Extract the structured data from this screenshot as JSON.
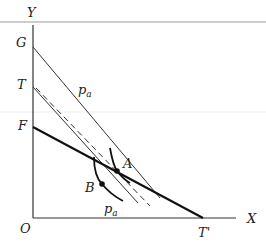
{
  "diagram": {
    "axes": {
      "y_label": "Y",
      "x_label": "X",
      "origin_label": "O"
    },
    "intercept_labels": {
      "G": "G",
      "T": "T",
      "F": "F",
      "T_prime": "T'"
    },
    "points": {
      "A": "A",
      "B": "B"
    },
    "curve_labels": {
      "upper": "p",
      "upper_sub": "a",
      "lower": "p",
      "lower_sub": "a"
    },
    "colors": {
      "ink": "#222222",
      "rule": "#c8c8c8"
    }
  }
}
